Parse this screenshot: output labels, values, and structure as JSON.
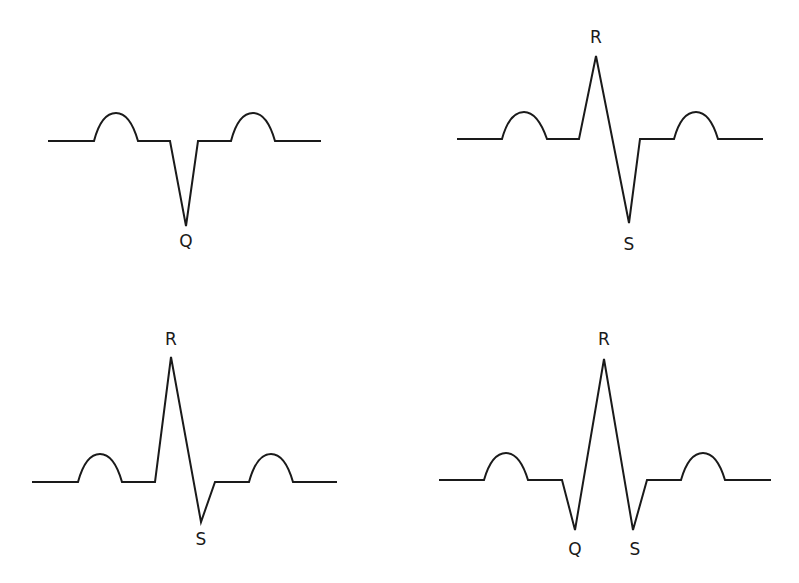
{
  "figure": {
    "panels": [
      {
        "id": "top-left",
        "morphology": "QS",
        "labels": [
          {
            "text": "Q",
            "x": 186,
            "y": 247
          }
        ],
        "path": "M48,141 L94,141 C100,118 108,113 116,113 C124,113 132,120 138,141 L170,141 L186,226 L198,141 L231,141 C237,118 245,113 253,113 C261,113 269,120 275,141 L321,141"
      },
      {
        "id": "top-right",
        "morphology": "RS",
        "labels": [
          {
            "text": "R",
            "x": 596,
            "y": 43
          },
          {
            "text": "S",
            "x": 629,
            "y": 250
          }
        ],
        "path": "M457,139 L502,139 C508,117 516,112 524,112 C532,112 540,119 547,139 L579,139 L596,56 L629,223 L640,139 L674,139 C680,117 688,112 696,112 C704,112 712,119 718,139 L763,139"
      },
      {
        "id": "bottom-left",
        "morphology": "Rs",
        "labels": [
          {
            "text": "R",
            "x": 171,
            "y": 345
          },
          {
            "text": "S",
            "x": 201,
            "y": 545
          }
        ],
        "path": "M32,482 L78,482 C84,460 92,454 100,454 C108,454 116,461 122,482 L155,482 L171,357 L201,522 L215,482 L249,482 C255,460 263,454 271,454 C279,454 287,461 293,482 L337,482"
      },
      {
        "id": "bottom-right",
        "morphology": "qRs",
        "labels": [
          {
            "text": "Q",
            "x": 575,
            "y": 555
          },
          {
            "text": "R",
            "x": 604,
            "y": 345
          },
          {
            "text": "S",
            "x": 635,
            "y": 555
          }
        ],
        "path": "M439,480 L484,480 C490,459 498,453 506,453 C514,453 522,460 528,480 L562,480 L575,530 L604,359 L633,530 L647,480 L681,480 C687,459 695,453 703,453 C711,453 719,460 725,480 L771,480"
      }
    ]
  }
}
